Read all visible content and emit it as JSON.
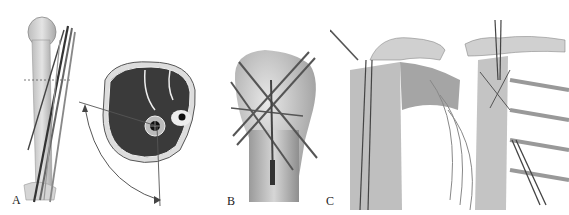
{
  "figure": {
    "panels": [
      {
        "id": "A",
        "label": "A",
        "description": "Humerus with transfixing pins and cross-section of arm showing safe zone arc"
      },
      {
        "id": "B",
        "label": "B",
        "description": "Proximal humerus with crossed K-wires fixation"
      },
      {
        "id": "C",
        "label": "C",
        "description": "Shoulder anatomy with pins, anterior views"
      }
    ],
    "colors": {
      "background": "#ffffff",
      "bone": "#cfcfcf",
      "bone_shade": "#a8a8a8",
      "muscle": "#3a3a3a",
      "pin": "#4a4a4a",
      "outline": "#555555"
    }
  }
}
